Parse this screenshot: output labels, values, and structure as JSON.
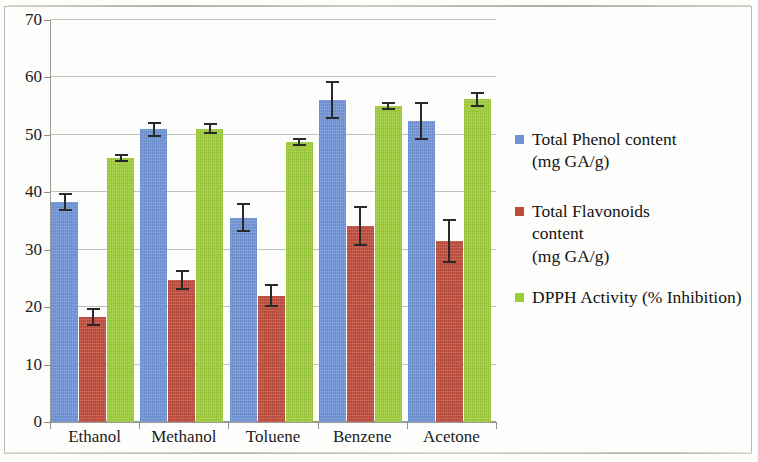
{
  "chart_data": {
    "type": "bar",
    "title": "",
    "subtitle": "",
    "xlabel": "",
    "ylabel": "",
    "ylim": [
      0,
      70
    ],
    "ytick_step": 10,
    "yticks": [
      0,
      10,
      20,
      30,
      40,
      50,
      60,
      70
    ],
    "grid": true,
    "legend_position": "right",
    "orientation": "vertical",
    "grouping": "clustered",
    "error_bars": true,
    "categories": [
      "Ethanol",
      "Methanol",
      "Toluene",
      "Benzene",
      "Acetone"
    ],
    "series": [
      {
        "name": "Total Phenol content (mg GA/g)",
        "color": "#6f93d6",
        "values": [
          38.3,
          51.0,
          35.6,
          56.0,
          52.4
        ],
        "errors": [
          1.5,
          1.3,
          2.5,
          3.3,
          3.3
        ]
      },
      {
        "name": "Total Flavonoids content (mg GA/g)",
        "color": "#bf4c3b",
        "values": [
          18.3,
          24.7,
          22.0,
          34.2,
          31.5
        ],
        "errors": [
          1.6,
          1.7,
          2.0,
          3.5,
          3.8
        ]
      },
      {
        "name": "DPPH Activity (% Inhibition)",
        "color": "#9dcc39",
        "values": [
          46.0,
          51.1,
          48.8,
          55.1,
          56.2
        ],
        "errors": [
          0.7,
          0.9,
          0.7,
          0.7,
          1.3
        ]
      }
    ]
  },
  "axes": {
    "y_tick_labels": [
      "70",
      "60",
      "50",
      "40",
      "30",
      "20",
      "10",
      "0"
    ],
    "x_tick_labels": [
      "Ethanol",
      "Methanol",
      "Toluene",
      "Benzene",
      "Acetone"
    ]
  },
  "legend": {
    "entries": [
      {
        "line1": "Total Phenol content",
        "line2": "(mg GA/g)",
        "line3": "",
        "color": "#6f93d6",
        "swatch_name": "legend-swatch-phenol"
      },
      {
        "line1": "Total Flavonoids",
        "line2": "content",
        "line3": "(mg GA/g)",
        "color": "#bf4c3b",
        "swatch_name": "legend-swatch-flavonoids"
      },
      {
        "line1": "DPPH Activity (% Inhibition)",
        "line2": "",
        "line3": "",
        "color": "#9dcc39",
        "swatch_name": "legend-swatch-dpph"
      }
    ]
  },
  "colors": {
    "phenol": "#6f93d6",
    "flavonoids": "#bf4c3b",
    "dpph": "#9dcc39",
    "gridline": "#c2c2bd",
    "axis": "#9a9a95",
    "text": "#1b1b1b",
    "background": "#fdfdfc"
  }
}
